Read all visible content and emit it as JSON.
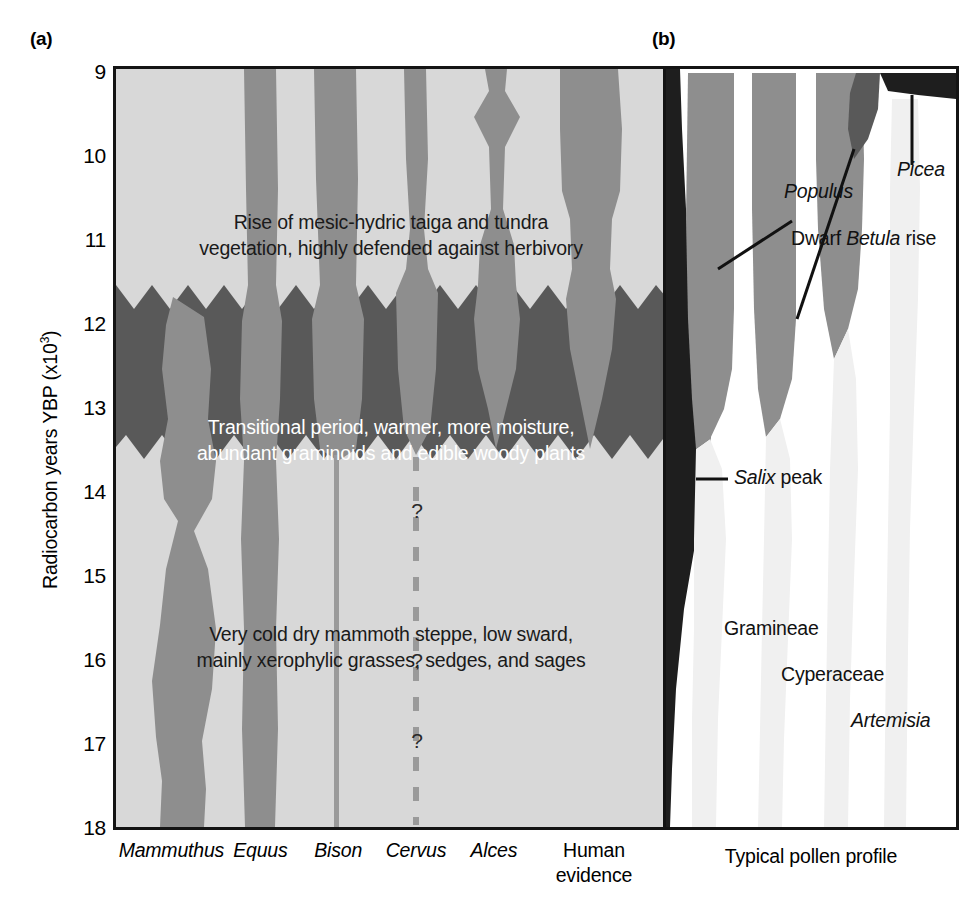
{
  "figure": {
    "panel_a_letter": "(a)",
    "panel_b_letter": "(b)",
    "y_axis_title_text": "Radiocarbon years YBP (x10",
    "y_axis_title_sup": "3",
    "y_axis_title_close": ")",
    "y_axis_title_full": "Radiocarbon years YBP (x10^3)",
    "y_ticks": [
      "9",
      "10",
      "11",
      "12",
      "13",
      "14",
      "15",
      "16",
      "17",
      "18"
    ],
    "y_min": 9,
    "y_max": 18
  },
  "panel_a": {
    "band_text_top_line1": "Rise of mesic-hydric taiga and tundra",
    "band_text_top_line2": "vegetation, highly defended against herbivory",
    "band_text_mid_line1": "Transitional period, warmer, more moisture,",
    "band_text_mid_line2": "abundant graminoids and edible woody plants",
    "band_text_bot_line1": "Very cold dry mammoth steppe, low sward,",
    "band_text_bot_line2": "mainly xerophylic grasses, sedges, and sages",
    "question_marks": [
      "?",
      "?",
      "?"
    ],
    "taxa": [
      {
        "name": "Mammuthus",
        "italic": true,
        "line2": ""
      },
      {
        "name": "Equus",
        "italic": true,
        "line2": ""
      },
      {
        "name": "Bison",
        "italic": true,
        "line2": ""
      },
      {
        "name": "Cervus",
        "italic": true,
        "line2": ""
      },
      {
        "name": "Alces",
        "italic": true,
        "line2": ""
      },
      {
        "name": "Human",
        "italic": false,
        "line2": "evidence"
      }
    ],
    "colors": {
      "background_light_gray": "#d8d8d8",
      "band_dark_gray": "#595959",
      "silhouette_gray": "#8e8e8e",
      "frame_black": "#141414",
      "dashed_line_gray": "#9a9a9a"
    }
  },
  "panel_b": {
    "caption": "Typical pollen profile",
    "labels": [
      {
        "id": "populus",
        "text": "Populus",
        "italic": true
      },
      {
        "id": "picea",
        "text": "Picea",
        "italic": true
      },
      {
        "id": "betula",
        "text_pre": "Dwarf ",
        "text_italic": "Betula",
        "text_post": " rise"
      },
      {
        "id": "salix",
        "text_italic": "Salix",
        "text_post": " peak"
      },
      {
        "id": "gramineae",
        "text": "Gramineae",
        "italic": false
      },
      {
        "id": "cyperaceae",
        "text": "Cyperaceae",
        "italic": false
      },
      {
        "id": "artemisia",
        "text": "Artemisia",
        "italic": true
      }
    ],
    "colors": {
      "curve_gray": "#8e8e8e",
      "curve_pale": "#f0f0f0",
      "salix_dark": "#1e1e1e",
      "frame_black": "#141414"
    }
  },
  "chart_data": {
    "type": "area",
    "ylabel": "Radiocarbon years YBP (x10^3)",
    "ylim": [
      9,
      18
    ],
    "y_inverted": true,
    "grid": false,
    "legend": "none",
    "panels": [
      {
        "id": "a",
        "label": "(a)",
        "xlabel": "",
        "categories": [
          "Mammuthus",
          "Equus",
          "Bison",
          "Cervus",
          "Alces",
          "Human evidence"
        ],
        "vegetation_zones": [
          {
            "name": "Rise of mesic-hydric taiga and tundra vegetation, highly defended against herbivory",
            "from": 9.0,
            "to": 11.6,
            "shade": "light"
          },
          {
            "name": "Transitional period, warmer, more moisture, abundant graminoids and edible woody plants",
            "from": 11.6,
            "to": 13.5,
            "shade": "dark"
          },
          {
            "name": "Very cold dry mammoth steppe, low sward, mainly xerophylic grasses, sedges, and sages",
            "from": 13.5,
            "to": 18.0,
            "shade": "light"
          }
        ],
        "series": [
          {
            "name": "Mammuthus",
            "x_center": 0.105,
            "widths": [
              [
                11.6,
                0.0
              ],
              [
                11.8,
                0.055
              ],
              [
                12.6,
                0.07
              ],
              [
                13.0,
                0.055
              ],
              [
                13.5,
                0.075
              ],
              [
                14.0,
                0.078
              ],
              [
                15.0,
                0.05
              ],
              [
                15.4,
                0.035
              ],
              [
                15.8,
                0.055
              ],
              [
                16.6,
                0.06
              ],
              [
                17.2,
                0.035
              ],
              [
                17.6,
                0.045
              ],
              [
                18.0,
                0.05
              ]
            ]
          },
          {
            "name": "Equus",
            "x_center": 0.265,
            "widths": [
              [
                9.0,
                0.035
              ],
              [
                11.0,
                0.035
              ],
              [
                11.6,
                0.04
              ],
              [
                13.5,
                0.04
              ],
              [
                14.0,
                0.035
              ],
              [
                18.0,
                0.035
              ]
            ]
          },
          {
            "name": "Bison",
            "x_center": 0.405,
            "widths": [
              [
                9.0,
                0.045
              ],
              [
                11.0,
                0.045
              ],
              [
                11.6,
                0.055
              ],
              [
                13.4,
                0.055
              ],
              [
                13.6,
                0.006
              ],
              [
                18.0,
                0.006
              ]
            ]
          },
          {
            "name": "Cervus",
            "x_center": 0.545,
            "widths": [
              [
                9.0,
                0.028
              ],
              [
                10.6,
                0.028
              ],
              [
                11.2,
                0.05
              ],
              [
                11.6,
                0.055
              ],
              [
                13.4,
                0.05
              ],
              [
                13.6,
                0.004
              ],
              [
                18.0,
                0.004
              ]
            ],
            "dashed_below": 13.6,
            "annotations": [
              "?",
              "?",
              "?"
            ]
          },
          {
            "name": "Alces",
            "x_center": 0.685,
            "widths": [
              [
                9.0,
                0.03
              ],
              [
                9.4,
                0.06
              ],
              [
                9.8,
                0.03
              ],
              [
                10.8,
                0.025
              ],
              [
                11.2,
                0.055
              ],
              [
                11.6,
                0.06
              ],
              [
                12.6,
                0.055
              ],
              [
                13.4,
                0.02
              ],
              [
                13.5,
                0.0
              ]
            ]
          },
          {
            "name": "Human evidence",
            "x_center": 0.855,
            "widths": [
              [
                9.0,
                0.085
              ],
              [
                10.6,
                0.09
              ],
              [
                11.0,
                0.07
              ],
              [
                11.6,
                0.07
              ],
              [
                12.6,
                0.06
              ],
              [
                13.4,
                0.03
              ],
              [
                13.5,
                0.0
              ]
            ]
          }
        ]
      },
      {
        "id": "b",
        "label": "(b)",
        "xlabel": "Typical pollen profile",
        "taxa": [
          "Salix",
          "Betula",
          "Populus",
          "Picea",
          "Gramineae",
          "Cyperaceae",
          "Artemisia"
        ],
        "annotations": [
          {
            "text": "Populus",
            "at_y": 9.6
          },
          {
            "text": "Picea",
            "at_y": 9.6
          },
          {
            "text": "Dwarf Betula rise",
            "at_y": 11.1
          },
          {
            "text": "Salix peak",
            "at_y": 13.2
          },
          {
            "text": "Gramineae",
            "at_y": 15.1
          },
          {
            "text": "Cyperaceae",
            "at_y": 15.7
          },
          {
            "text": "Artemisia",
            "at_y": 16.3
          }
        ]
      }
    ]
  }
}
